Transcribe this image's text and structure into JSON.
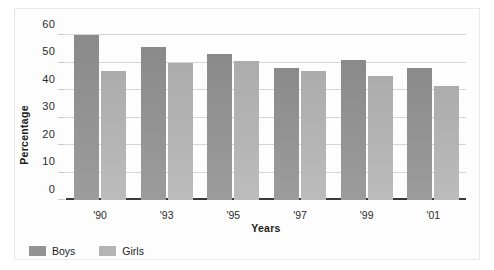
{
  "chart_data": {
    "type": "bar",
    "title": "",
    "xlabel": "Years",
    "ylabel": "Percentage",
    "categories": [
      "'90",
      "'93",
      "'95",
      "'97",
      "'99",
      "'01"
    ],
    "series": [
      {
        "name": "Boys",
        "color": "#949494",
        "values": [
          60,
          55.5,
          53,
          48,
          51,
          48
        ]
      },
      {
        "name": "Girls",
        "color": "#b4b4b4",
        "values": [
          47,
          50,
          50.5,
          47,
          45,
          41.5
        ]
      }
    ],
    "ylim": [
      0,
      60
    ],
    "ytick_labels": [
      "60",
      "50",
      "40",
      "30",
      "20",
      "10",
      "0"
    ],
    "ytick_values": [
      60,
      50,
      40,
      30,
      20,
      10,
      0
    ],
    "grid": true,
    "legend_position": "bottom-left",
    "background_color": "#fdfdfd",
    "gridline_color": "#d6d6d6",
    "axis_color": "#3a3a3a"
  }
}
